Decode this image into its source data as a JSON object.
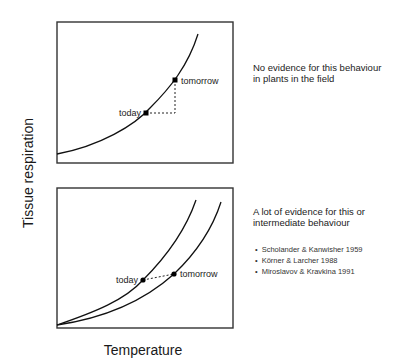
{
  "axes": {
    "y_label": "Tissue respiration",
    "x_label": "Temperature"
  },
  "top_panel": {
    "point_today": "today",
    "point_tomorrow": "tomorrow",
    "note": "No evidence for this behaviour in plants in the field"
  },
  "bottom_panel": {
    "point_today": "today",
    "point_tomorrow": "tomorrow",
    "note": "A lot of evidence for this or intermediate behaviour",
    "references": [
      "Scholander & Kanwisher 1959",
      "Körner & Larcher  1988",
      "Miroslavov & Kravkina 1991"
    ]
  },
  "colors": {
    "line": "#111111",
    "frame": "#333333",
    "background": "#ffffff"
  }
}
